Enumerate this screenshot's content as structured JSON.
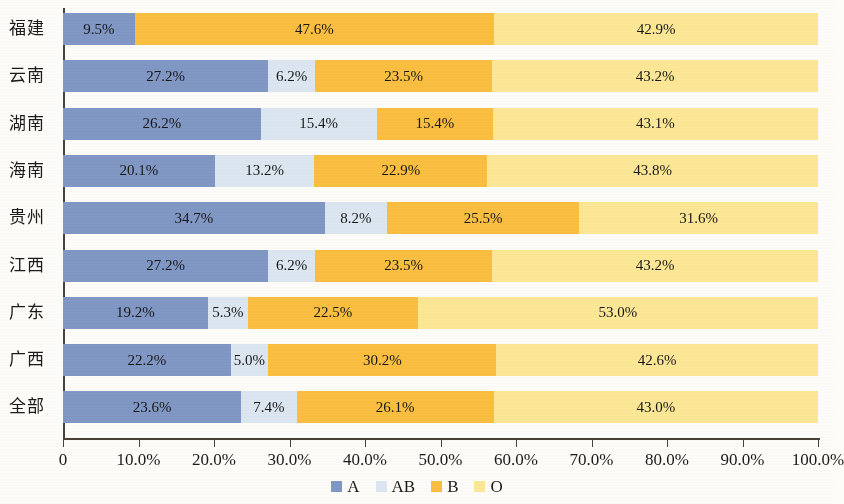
{
  "chart_data": {
    "type": "bar",
    "orientation": "horizontal",
    "stacked": true,
    "normalized": true,
    "title": "",
    "subtitle": "",
    "xlabel": "",
    "ylabel": "",
    "xlim": [
      0,
      100
    ],
    "grid": false,
    "legend_position": "bottom-center",
    "value_suffix": "%",
    "categories": [
      "福建",
      "云南",
      "湖南",
      "海南",
      "贵州",
      "江西",
      "广东",
      "广西",
      "全部"
    ],
    "tick_labels": [
      "0",
      "10.0%",
      "20.0%",
      "30.0%",
      "40.0%",
      "50.0%",
      "60.0%",
      "70.0%",
      "80.0%",
      "90.0%",
      "100.0%"
    ],
    "tick_values": [
      0,
      10,
      20,
      30,
      40,
      50,
      60,
      70,
      80,
      90,
      100
    ],
    "series": [
      {
        "name": "A",
        "color": "#8197c4",
        "values": [
          9.5,
          27.2,
          26.2,
          20.1,
          34.7,
          27.2,
          19.2,
          22.2,
          23.6
        ],
        "labels": [
          "9.5%",
          "27.2%",
          "26.2%",
          "20.1%",
          "34.7%",
          "27.2%",
          "19.2%",
          "22.2%",
          "23.6%"
        ]
      },
      {
        "name": "AB",
        "color": "#dce6f0",
        "values": [
          0,
          6.2,
          15.4,
          13.2,
          8.2,
          6.2,
          5.3,
          5.0,
          7.4
        ],
        "labels": [
          "",
          "6.2%",
          "15.4%",
          "13.2%",
          "8.2%",
          "6.2%",
          "5.3%",
          "5.0%",
          "7.4%"
        ]
      },
      {
        "name": "B",
        "color": "#fabe40",
        "values": [
          47.6,
          23.5,
          15.4,
          22.9,
          25.5,
          23.5,
          22.5,
          30.2,
          26.1
        ],
        "labels": [
          "47.6%",
          "23.5%",
          "15.4%",
          "22.9%",
          "25.5%",
          "23.5%",
          "22.5%",
          "30.2%",
          "26.1%"
        ]
      },
      {
        "name": "O",
        "color": "#fbe795",
        "values": [
          42.9,
          43.2,
          43.1,
          43.8,
          31.6,
          43.2,
          53.0,
          42.6,
          43.0
        ],
        "labels": [
          "42.9%",
          "43.2%",
          "43.1%",
          "43.8%",
          "31.6%",
          "43.2%",
          "53.0%",
          "42.6%",
          "43.0%"
        ]
      }
    ]
  },
  "legend": {
    "items": [
      {
        "label": "A",
        "color": "#8197c4"
      },
      {
        "label": "AB",
        "color": "#dce6f0"
      },
      {
        "label": "B",
        "color": "#fabe40"
      },
      {
        "label": "O",
        "color": "#fbe795"
      }
    ]
  }
}
